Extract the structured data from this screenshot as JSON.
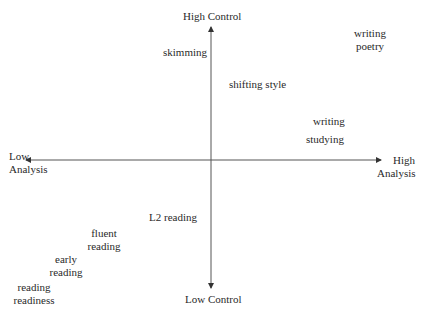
{
  "axes": {
    "top": "High Control",
    "bottom": "Low Control",
    "left": [
      "Low",
      "Analysis"
    ],
    "right": [
      "High",
      "Analysis"
    ]
  },
  "items": [
    {
      "id": "skimming",
      "lines": [
        "skimming"
      ]
    },
    {
      "id": "writing-poetry",
      "lines": [
        "writing",
        "poetry"
      ]
    },
    {
      "id": "shifting-style",
      "lines": [
        "shifting style"
      ]
    },
    {
      "id": "writing",
      "lines": [
        "writing"
      ]
    },
    {
      "id": "studying",
      "lines": [
        "studying"
      ]
    },
    {
      "id": "l2-reading",
      "lines": [
        "L2 reading"
      ]
    },
    {
      "id": "fluent-reading",
      "lines": [
        "fluent",
        "reading"
      ]
    },
    {
      "id": "early-reading",
      "lines": [
        "early",
        "reading"
      ]
    },
    {
      "id": "reading-readiness",
      "lines": [
        "reading",
        "readiness"
      ]
    }
  ],
  "colors": {
    "line": "#555555",
    "text": "#2a2a2a"
  }
}
